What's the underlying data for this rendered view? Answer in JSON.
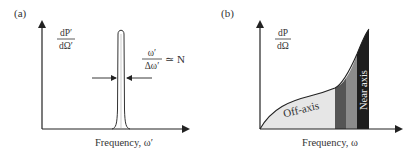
{
  "panel_a": {
    "label": "(a)",
    "y_label_num": "dP′",
    "y_label_den": "dΩ′",
    "x_label": "Frequency, ω′",
    "annotation_num": "ω′",
    "annotation_den": "Δω′",
    "annotation_rel": "≃ N"
  },
  "panel_b": {
    "label": "(b)",
    "y_label_num": "dP",
    "y_label_den": "dΩ",
    "x_label": "Frequency, ω",
    "region_off_axis": "Off-axis",
    "region_near_axis": "Near axis"
  },
  "colors": {
    "axis": "#222222",
    "off_axis_fill": "#e6e6e6",
    "band_dark_gray": "#555555",
    "band_mid_gray": "#8c8c8c",
    "band_black": "#1e1e1e"
  }
}
